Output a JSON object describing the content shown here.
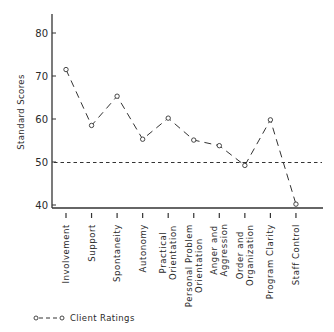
{
  "chart_data": {
    "type": "line",
    "title": "",
    "xlabel": "",
    "ylabel": "Standard Scores",
    "ylim": [
      40,
      85
    ],
    "yticks": [
      40,
      50,
      60,
      70,
      80
    ],
    "grid": false,
    "legend_position": "bottom-left",
    "categories": [
      "Involvement",
      "Support",
      "Spontaneity",
      "Autonomy",
      "Practical Orientation",
      "Personal Problem Orientation",
      "Anger and Aggression",
      "Order and Organization",
      "Program Clarity",
      "Staff Control"
    ],
    "category_lines": [
      [
        "Involvement"
      ],
      [
        "Support"
      ],
      [
        "Spontaneity"
      ],
      [
        "Autonomy"
      ],
      [
        "Practical",
        "Orientation"
      ],
      [
        "Personal Problem",
        "Orientation"
      ],
      [
        "Anger and",
        "Aggression"
      ],
      [
        "Order and",
        "Organization"
      ],
      [
        "Program Clarity"
      ],
      [
        "Staff Control"
      ]
    ],
    "series": [
      {
        "name": "Client Ratings",
        "style": "dashed line with open circle markers",
        "values": [
          71.5,
          58.5,
          65.3,
          55.3,
          60.2,
          55.1,
          53.8,
          49.2,
          59.8,
          40.2
        ]
      }
    ],
    "reference_line": {
      "y": 50,
      "style": "dotted",
      "label": ""
    }
  },
  "legend": {
    "label": "Client Ratings"
  },
  "axis": {
    "ylabel": "Standard Scores"
  }
}
